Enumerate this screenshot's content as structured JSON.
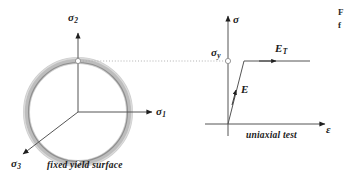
{
  "figure": {
    "title_fragment_right": "F",
    "title_fragment_right_line2": "f",
    "yield_surface": {
      "caption": "fixed yield surface",
      "axis_labels": {
        "sigma2": "σ",
        "sigma2_sub": "2",
        "sigma1": "σ",
        "sigma1_sub": "1",
        "sigma3": "σ",
        "sigma3_sub": "3"
      },
      "ring_color": "#b9b9b9",
      "ring_inner_color": "#8c8c8c",
      "axis_color": "#4d4d4d",
      "marker_fill": "#ffffff",
      "marker_stroke": "#8c8c8c"
    },
    "uniaxial": {
      "caption": "uniaxial test",
      "axis_labels": {
        "sigma": "σ",
        "epsilon": "ε"
      },
      "yield_label": "σ",
      "yield_label_sub": "y",
      "elastic_modulus": "E",
      "tangent_modulus": "E",
      "tangent_modulus_sub": "T",
      "curve_color": "#4d4d4d",
      "axis_color": "#4d4d4d",
      "dotted_color": "#9a9a9a"
    },
    "connector": {
      "style": "dotted",
      "color": "#a8a8a8"
    }
  }
}
